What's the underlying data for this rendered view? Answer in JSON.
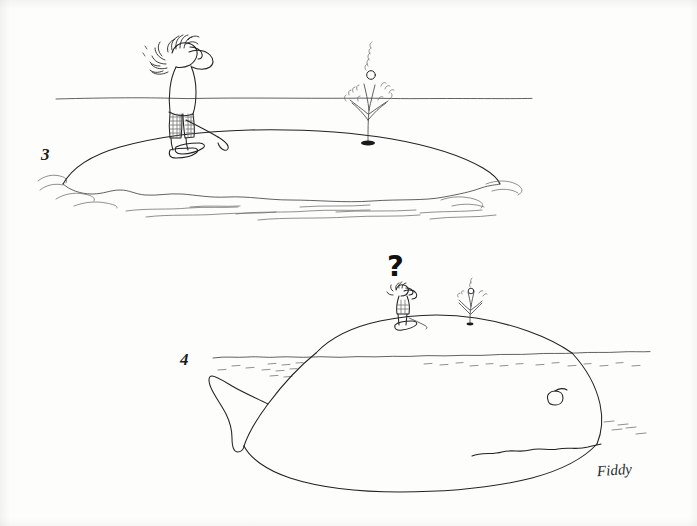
{
  "artwork": {
    "title": "Golfer and whale cartoon strip (panels 3 and 4)",
    "medium": "pen and ink line drawing",
    "background_color": "#fdfdfc",
    "ink_color": "#222222",
    "signature": "Fiddy"
  },
  "panels": [
    {
      "number": "3",
      "number_position": {
        "x": 41,
        "y": 145
      },
      "caption": "",
      "scene": "golfer on a small island watching a spout of water with his golf ball at the top",
      "elements": [
        {
          "name": "horizon-line",
          "label": "horizon"
        },
        {
          "name": "island",
          "label": "island mound"
        },
        {
          "name": "golfer",
          "label": "golfer shading his eyes"
        },
        {
          "name": "golf-club",
          "label": "golf club"
        },
        {
          "name": "water-spout",
          "label": "spout of water"
        },
        {
          "name": "golf-ball",
          "label": "golf ball"
        },
        {
          "name": "blowhole",
          "label": "hole in the ground"
        },
        {
          "name": "water-ripples",
          "label": "water ripples"
        }
      ]
    },
    {
      "number": "4",
      "number_position": {
        "x": 180,
        "y": 350
      },
      "caption": "",
      "question_mark": "?",
      "scene": "the island turns out to be a whale; the tiny golfer stands on its back, puzzled",
      "elements": [
        {
          "name": "waterline",
          "label": "water line"
        },
        {
          "name": "whale",
          "label": "whale"
        },
        {
          "name": "whale-eye",
          "label": "whale eye"
        },
        {
          "name": "whale-mouth",
          "label": "whale mouth"
        },
        {
          "name": "whale-tail",
          "label": "whale tail fluke"
        },
        {
          "name": "golfer-small",
          "label": "tiny golfer on the whale's back"
        },
        {
          "name": "water-spout-small",
          "label": "small spout from the blowhole"
        },
        {
          "name": "question-mark",
          "label": "?"
        }
      ]
    }
  ],
  "signature": {
    "text": "Fiddy",
    "position": {
      "x": 597,
      "y": 462
    }
  }
}
